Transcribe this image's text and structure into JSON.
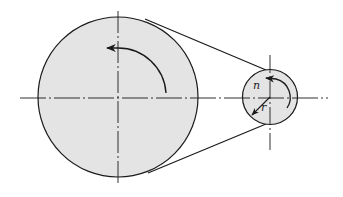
{
  "diagram": {
    "labels": {
      "speed": "n",
      "radius": "r"
    },
    "colors": {
      "pulley_fill": "#e4e4e4",
      "stroke": "#1a1a1a",
      "background": "#ffffff"
    },
    "elements": {
      "large_pulley": "driving pulley",
      "small_pulley": "driven pulley",
      "belt": "open belt",
      "large_rotation": "counter-clockwise",
      "small_rotation": "counter-clockwise"
    }
  }
}
